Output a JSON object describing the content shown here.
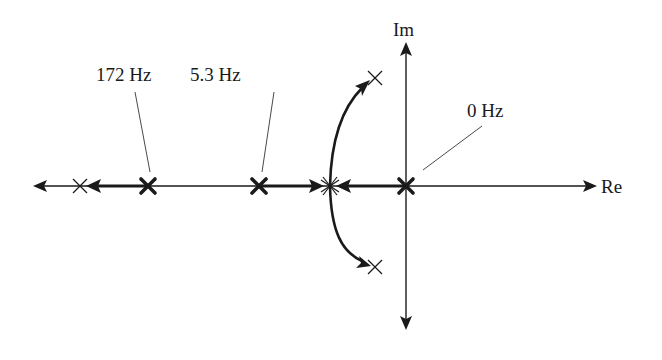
{
  "diagram": {
    "type": "root-locus",
    "colors": {
      "ink": "#1a1a1a",
      "background": "#ffffff"
    },
    "axes": {
      "real_label": "Re",
      "imag_label": "Im"
    },
    "labels": {
      "pole_172": "172 Hz",
      "pole_5_3": "5.3 Hz",
      "pole_0": "0 Hz"
    },
    "open_loop_poles": [
      {
        "label": "172 Hz",
        "marker": "bold-x"
      },
      {
        "label": "5.3 Hz",
        "marker": "bold-x"
      },
      {
        "label": "0 Hz",
        "marker": "bold-x"
      }
    ],
    "closed_loop_poles": [
      {
        "position": "real-axis-far-left",
        "marker": "thin-x"
      },
      {
        "position": "breakaway-point",
        "marker": "thin-x"
      },
      {
        "position": "upper-complex",
        "marker": "thin-x"
      },
      {
        "position": "lower-complex",
        "marker": "thin-x"
      }
    ]
  }
}
